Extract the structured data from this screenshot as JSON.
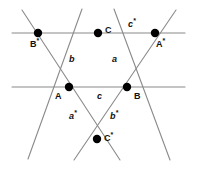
{
  "figure": {
    "width": 197,
    "height": 169,
    "background_color": "#ffffff",
    "line_color": "#8a8a8a",
    "point_color": "#000000",
    "label_color": "#111111"
  },
  "points": [
    {
      "id": "B-star",
      "label_text": "B",
      "label_sup": "*",
      "x": 38,
      "y": 33,
      "label_x": 30,
      "label_y": 40,
      "radius": 4.2
    },
    {
      "id": "C",
      "label_text": "C",
      "label_sup": "",
      "x": 98,
      "y": 33,
      "label_x": 105,
      "label_y": 26,
      "radius": 4.2
    },
    {
      "id": "A-star",
      "label_text": "A",
      "label_sup": "*",
      "x": 155,
      "y": 33,
      "label_x": 156,
      "label_y": 40,
      "radius": 4.2
    },
    {
      "id": "A",
      "label_text": "A",
      "label_sup": "",
      "x": 69,
      "y": 87,
      "label_x": 55,
      "label_y": 92,
      "radius": 4.2
    },
    {
      "id": "B",
      "label_text": "B",
      "label_sup": "",
      "x": 127,
      "y": 87,
      "label_x": 134,
      "label_y": 92,
      "radius": 4.2
    },
    {
      "id": "C-star",
      "label_text": "C",
      "label_sup": "*",
      "x": 97,
      "y": 139,
      "label_x": 104,
      "label_y": 134,
      "radius": 4.2
    }
  ],
  "segment_labels": [
    {
      "id": "b",
      "text": "b",
      "sup": "",
      "x": 69,
      "y": 55
    },
    {
      "id": "a",
      "text": "a",
      "sup": "",
      "x": 112,
      "y": 55
    },
    {
      "id": "c",
      "text": "c",
      "sup": "",
      "x": 97,
      "y": 92
    },
    {
      "id": "c-star",
      "text": "c",
      "sup": "*",
      "x": 128,
      "y": 20
    },
    {
      "id": "a-star",
      "text": "a",
      "sup": "*",
      "x": 69,
      "y": 112
    },
    {
      "id": "b-star",
      "text": "b",
      "sup": "*",
      "x": 110,
      "y": 112
    }
  ],
  "lines": [
    {
      "id": "horizontal-upper",
      "x1": 12,
      "y1": 33,
      "x2": 185,
      "y2": 33
    },
    {
      "id": "horizontal-lower",
      "x1": 12,
      "y1": 87,
      "x2": 185,
      "y2": 87
    },
    {
      "id": "diagonal-left-down",
      "x1": 22,
      "y1": 10,
      "x2": 120,
      "y2": 160
    },
    {
      "id": "diagonal-right-down",
      "x1": 176,
      "y1": 10,
      "x2": 74,
      "y2": 160
    },
    {
      "id": "diagonal-c-left",
      "x1": 82,
      "y1": 9,
      "x2": 28,
      "y2": 159
    },
    {
      "id": "diagonal-c-right",
      "x1": 114,
      "y1": 9,
      "x2": 170,
      "y2": 160
    }
  ]
}
